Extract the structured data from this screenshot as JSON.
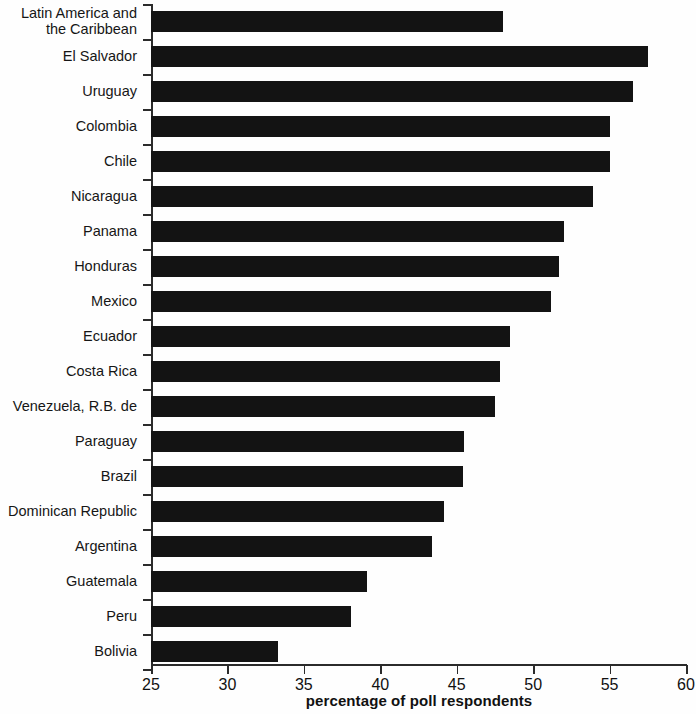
{
  "chart_data": {
    "type": "bar",
    "orientation": "horizontal",
    "title": "",
    "subtitle": "",
    "xlabel": "percentage of poll respondents",
    "ylabel": "",
    "xlim": [
      25,
      60
    ],
    "xticks": [
      25,
      30,
      35,
      40,
      45,
      50,
      55,
      60
    ],
    "xtick_labels": [
      "25",
      "30",
      "35",
      "40",
      "45",
      "50",
      "55",
      "60"
    ],
    "grid": false,
    "legend": null,
    "bar_color": "#131313",
    "axis_color": "#2b2b2b",
    "background_color": "#fefefe",
    "categories": [
      "Latin America and\nthe Caribbean",
      "El Salvador",
      "Uruguay",
      "Colombia",
      "Chile",
      "Nicaragua",
      "Panama",
      "Honduras",
      "Mexico",
      "Ecuador",
      "Costa Rica",
      "Venezuela, R.B. de",
      "Paraguay",
      "Brazil",
      "Dominican Republic",
      "Argentina",
      "Guatemala",
      "Peru",
      "Bolivia"
    ],
    "values": [
      48.0,
      57.5,
      56.5,
      55.0,
      55.0,
      53.9,
      52.0,
      51.7,
      51.2,
      48.5,
      47.8,
      47.5,
      45.5,
      45.4,
      44.2,
      43.4,
      39.1,
      38.1,
      33.3
    ],
    "series": [
      {
        "name": "percentage of poll respondents",
        "values": [
          48.0,
          57.5,
          56.5,
          55.0,
          55.0,
          53.9,
          52.0,
          51.7,
          51.2,
          48.5,
          47.8,
          47.5,
          45.5,
          45.4,
          44.2,
          43.4,
          39.1,
          38.1,
          33.3
        ]
      }
    ]
  }
}
